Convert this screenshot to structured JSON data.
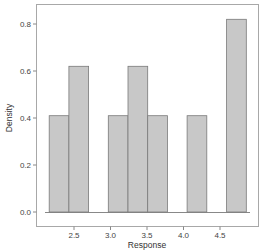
{
  "chart_data": {
    "type": "bar",
    "subtype": "histogram",
    "title": "",
    "xlabel": "Response",
    "ylabel": "Density",
    "xlim": [
      2.0,
      5.0
    ],
    "ylim": [
      0.0,
      0.85
    ],
    "xticks": [
      2.5,
      3.0,
      3.5,
      4.0,
      4.5
    ],
    "xtick_labels": [
      "2.5",
      "3.0",
      "3.5",
      "4.0",
      "4.5"
    ],
    "yticks": [
      0.0,
      0.2,
      0.4,
      0.6,
      0.8
    ],
    "ytick_labels": [
      "0.0",
      "0.2",
      "0.4",
      "0.6",
      "0.8"
    ],
    "grid": false,
    "legend": null,
    "bins": [
      {
        "x0": 2.16,
        "x1": 2.43,
        "density": 0.41
      },
      {
        "x0": 2.43,
        "x1": 2.7,
        "density": 0.62
      },
      {
        "x0": 2.7,
        "x1": 2.97,
        "density": 0.0
      },
      {
        "x0": 2.97,
        "x1": 3.24,
        "density": 0.41
      },
      {
        "x0": 3.24,
        "x1": 3.51,
        "density": 0.62
      },
      {
        "x0": 3.51,
        "x1": 3.78,
        "density": 0.41
      },
      {
        "x0": 3.78,
        "x1": 4.05,
        "density": 0.0
      },
      {
        "x0": 4.05,
        "x1": 4.32,
        "density": 0.41
      },
      {
        "x0": 4.32,
        "x1": 4.59,
        "density": 0.0
      },
      {
        "x0": 4.59,
        "x1": 4.86,
        "density": 0.82
      }
    ],
    "colors": {
      "bar_fill": "#c8c8c8",
      "bar_edge": "#7a7a7a",
      "axis": "#888888",
      "frame": "#a0a0a0"
    }
  }
}
